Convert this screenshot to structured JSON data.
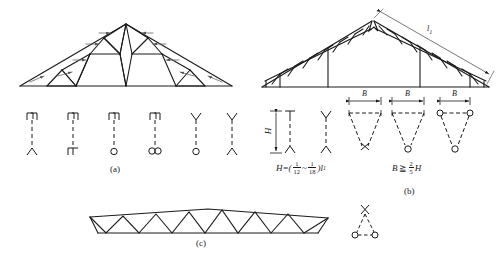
{
  "figure": {
    "line_color": "#1a1a1a",
    "background": "#ffffff"
  },
  "captions": {
    "a": "(a)",
    "b": "(b)",
    "c": "(c)"
  },
  "labels": {
    "span_l1": "l",
    "span_l1_sub": "1",
    "height_H": "H",
    "width_B": "B"
  },
  "formulas": {
    "height": {
      "lhs": "H",
      "eq": "=",
      "open": "(",
      "frac1_num": "1",
      "frac1_den": "12",
      "tilde": "~",
      "frac2_num": "1",
      "frac2_den": "18",
      "close": ")",
      "rhs_var": "l",
      "rhs_sub": "1",
      "plain": "H=(1/12 ~ 1/18)l1"
    },
    "width": {
      "lhs": "B",
      "op": "≧",
      "frac_num": "2",
      "frac_den": "5",
      "rhs": "H",
      "plain": "B ≧ (2/5)H"
    }
  },
  "trusses": [
    {
      "id": "a",
      "type": "triangular-fink-truss",
      "description": "Symmetric triangular truss with nested triangular web panels and member force arrows",
      "span_px": 268,
      "rise_px": 60,
      "panels": 8
    },
    {
      "id": "b",
      "type": "triangular-truss-with-posts",
      "description": "Triangular truss with lattice web, two vertical posts and ridge notch; rafter length dimensioned l1",
      "span_px": 230,
      "rise_px": 58,
      "posts": 2
    },
    {
      "id": "c",
      "type": "shallow-cambered-truss",
      "description": "Shallow cambered parallel-chord truss with zigzag (warren) web",
      "span_px": 220,
      "rise_px": 14,
      "web_bays": 14
    }
  ],
  "joint_symbols_row_a": [
    {
      "index": 1,
      "top": "channel-pair",
      "bottom": "fork",
      "stem": "dashed",
      "name": "joint-symbol-a1"
    },
    {
      "index": 2,
      "top": "channel-pair",
      "bottom": "step",
      "stem": "dashed",
      "name": "joint-symbol-a2"
    },
    {
      "index": 3,
      "top": "channel-pair",
      "bottom": "single-circle",
      "stem": "dashed",
      "name": "joint-symbol-a3"
    },
    {
      "index": 4,
      "top": "channel-pair",
      "bottom": "double-circle",
      "stem": "dashed",
      "name": "joint-symbol-a4"
    },
    {
      "index": 5,
      "top": "fork",
      "bottom": "single-circle",
      "stem": "dashed",
      "name": "joint-symbol-a5"
    },
    {
      "index": 6,
      "top": "fork",
      "bottom": "fork",
      "stem": "dashed",
      "name": "joint-symbol-a6"
    }
  ],
  "joint_symbols_row_b": [
    {
      "index": 1,
      "kind": "height-dimension",
      "label": "H",
      "name": "height-dimension-marker"
    },
    {
      "index": 2,
      "kind": "column-symbol",
      "top": "tee",
      "bottom": "fork",
      "name": "joint-symbol-b1"
    },
    {
      "index": 3,
      "kind": "column-symbol",
      "top": "fork",
      "bottom": "fork",
      "name": "joint-symbol-b2"
    },
    {
      "index": 4,
      "kind": "a-frame",
      "top": "ticks",
      "apex": "cross",
      "label": "B",
      "name": "a-frame-symbol-b3"
    },
    {
      "index": 5,
      "kind": "a-frame",
      "top": "ticks",
      "apex": "circle",
      "label": "B",
      "name": "a-frame-symbol-b4"
    },
    {
      "index": 6,
      "kind": "a-frame",
      "top": "circles",
      "apex": "circle",
      "label": "B",
      "name": "a-frame-symbol-b5"
    }
  ],
  "joint_symbol_row_c": {
    "kind": "tripod",
    "top": "cross",
    "feet": "two-circles",
    "name": "tripod-symbol-c1"
  }
}
